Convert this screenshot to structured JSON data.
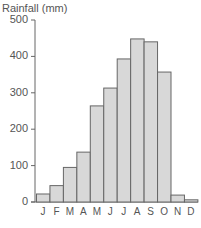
{
  "chart_data": {
    "type": "bar",
    "title": "",
    "xlabel": "",
    "ylabel": "Rainfall (mm)",
    "categories": [
      "J",
      "F",
      "M",
      "A",
      "M",
      "J",
      "J",
      "A",
      "S",
      "O",
      "N",
      "D"
    ],
    "values": [
      22,
      45,
      95,
      137,
      264,
      313,
      393,
      448,
      440,
      357,
      19,
      6
    ],
    "ylim": [
      0,
      500
    ],
    "yticks": [
      0,
      100,
      200,
      300,
      400,
      500
    ],
    "grid": false,
    "legend": null,
    "colors": {
      "bar_fill": "#d8d8d8",
      "bar_stroke": "#666666",
      "axis": "#666666",
      "text": "#555555"
    }
  }
}
